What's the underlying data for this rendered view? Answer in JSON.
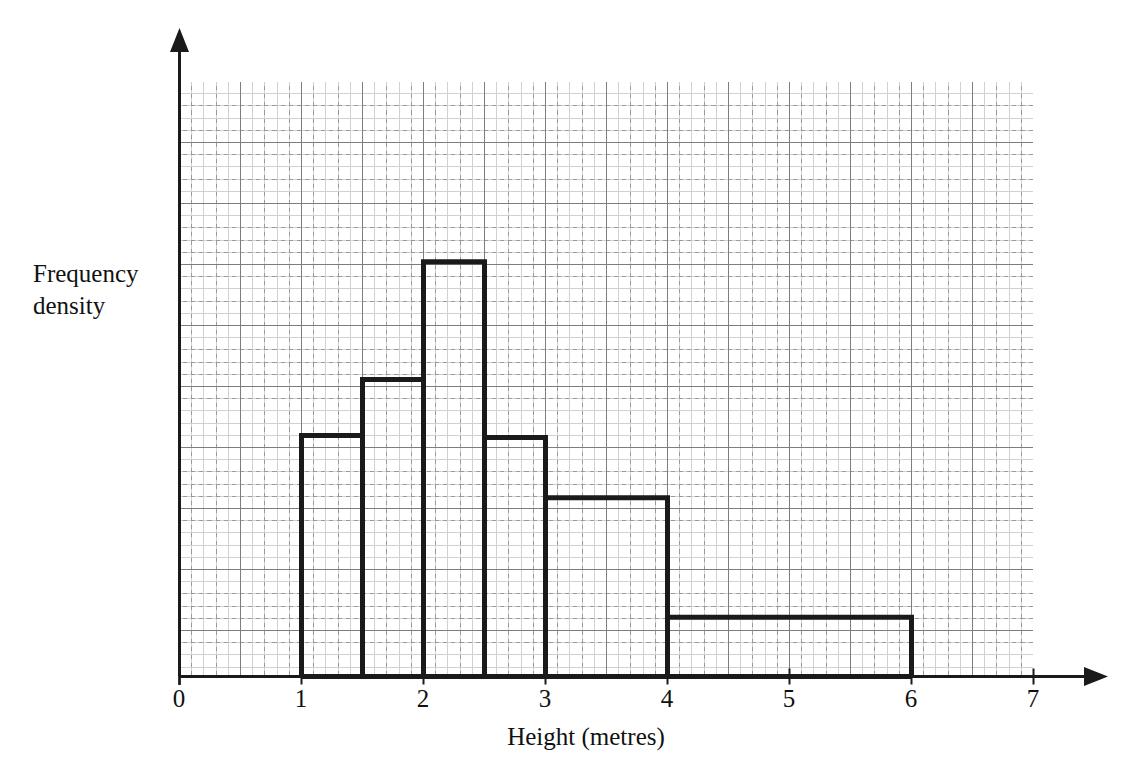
{
  "chart_data": {
    "type": "bar",
    "title": "",
    "xlabel": "Height (metres)",
    "ylabel": "Frequency\ndensity",
    "xlim": [
      0,
      7
    ],
    "ylim": [
      0,
      9.75
    ],
    "grid": true,
    "legend": "none",
    "xticks": [
      "0",
      "1",
      "2",
      "3",
      "4",
      "5",
      "6",
      "7"
    ],
    "xtick_values": [
      0,
      1,
      2,
      3,
      4,
      5,
      6,
      7
    ],
    "yticks": [],
    "bar_edge_color": "#1a1a1a",
    "bar_fill_color": "none",
    "grid_major_color": "#8a8a8a",
    "grid_minor_color": "#9a9a9a",
    "axis_color": "#1a1a1a",
    "bins": [
      {
        "label": "1 - 1.5",
        "x0": 1.0,
        "x1": 1.5,
        "height": 3.95
      },
      {
        "label": "1.5 - 2",
        "x0": 1.5,
        "x1": 2.0,
        "height": 4.87
      },
      {
        "label": "2 - 2.5",
        "x0": 2.0,
        "x1": 2.5,
        "height": 6.8
      },
      {
        "label": "2.5 - 3",
        "x0": 2.5,
        "x1": 3.0,
        "height": 3.92
      },
      {
        "label": "3 - 4",
        "x0": 3.0,
        "x1": 4.0,
        "height": 2.93
      },
      {
        "label": "4 - 6",
        "x0": 4.0,
        "x1": 6.0,
        "height": 0.97
      }
    ]
  },
  "axis": {
    "x_label": "Height (metres)",
    "y_label_line1": "Frequency",
    "y_label_line2": "density"
  },
  "ticks": {
    "t0": "0",
    "t1": "1",
    "t2": "2",
    "t3": "3",
    "t4": "4",
    "t5": "5",
    "t6": "6",
    "t7": "7"
  }
}
